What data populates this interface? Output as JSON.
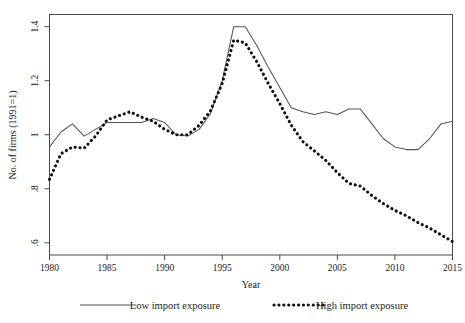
{
  "chart_data": {
    "type": "line",
    "title": "",
    "xlabel": "Year",
    "ylabel": "No. of firms (1991=1)",
    "xlim": [
      1980,
      2015
    ],
    "ylim": [
      0.555,
      1.445
    ],
    "grid": false,
    "legend_position": "bottom",
    "xticks": [
      1980,
      1985,
      1990,
      1995,
      2000,
      2005,
      2010,
      2015
    ],
    "xtick_labels": [
      "1980",
      "1985",
      "1990",
      "1995",
      "2000",
      "2005",
      "2010",
      "2015"
    ],
    "yticks": [
      0.6,
      0.8,
      1.0,
      1.2,
      1.4
    ],
    "ytick_labels": [
      ".6",
      ".8",
      "1",
      "1.2",
      "1.4"
    ],
    "x": [
      1980,
      1981,
      1982,
      1983,
      1984,
      1985,
      1986,
      1987,
      1988,
      1989,
      1990,
      1991,
      1992,
      1993,
      1994,
      1995,
      1996,
      1997,
      1998,
      1999,
      2000,
      2001,
      2002,
      2003,
      2004,
      2005,
      2006,
      2007,
      2008,
      2009,
      2010,
      2011,
      2012,
      2013,
      2014,
      2015
    ],
    "series": [
      {
        "name": "Low import exposure",
        "style": "solid",
        "color": "#555555",
        "values": [
          0.955,
          1.01,
          1.04,
          0.995,
          1.02,
          1.045,
          1.045,
          1.045,
          1.045,
          1.06,
          1.045,
          1.0,
          0.995,
          1.02,
          1.08,
          1.2,
          1.4,
          1.4,
          1.33,
          1.25,
          1.175,
          1.1,
          1.085,
          1.075,
          1.085,
          1.075,
          1.095,
          1.095,
          1.04,
          0.985,
          0.955,
          0.945,
          0.945,
          0.985,
          1.04,
          1.05
        ]
      },
      {
        "name": "High import exposure",
        "style": "dotted",
        "color": "#111111",
        "values": [
          0.835,
          0.93,
          0.955,
          0.95,
          0.995,
          1.055,
          1.07,
          1.085,
          1.065,
          1.05,
          1.02,
          1.0,
          1.0,
          1.035,
          1.09,
          1.19,
          1.35,
          1.34,
          1.27,
          1.19,
          1.115,
          1.035,
          0.975,
          0.94,
          0.905,
          0.86,
          0.82,
          0.81,
          0.775,
          0.745,
          0.72,
          0.7,
          0.675,
          0.655,
          0.63,
          0.605
        ]
      }
    ]
  },
  "legend": {
    "entries": [
      {
        "label": "Low import exposure",
        "style": "solid"
      },
      {
        "label": "High import exposure",
        "style": "dotted"
      }
    ]
  }
}
